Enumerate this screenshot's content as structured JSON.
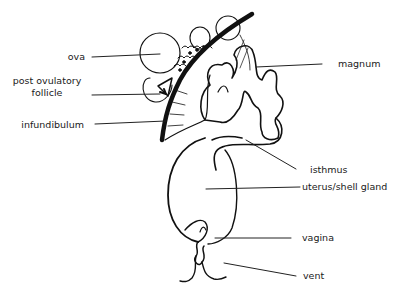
{
  "diagram": {
    "labels": {
      "ova": "ova",
      "post_ovulatory_1": "post ovulatory",
      "post_ovulatory_2": "follicle",
      "infundibulum": "infundibulum",
      "magnum": "magnum",
      "isthmus": "isthmus",
      "uterus": "uterus/shell gland",
      "vagina": "vagina",
      "vent": "vent"
    },
    "colors": {
      "stroke": "#111111",
      "text": "#1a1a1a",
      "background": "#ffffff"
    }
  }
}
